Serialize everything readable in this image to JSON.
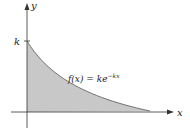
{
  "diagram": {
    "y_axis_label": "y",
    "x_axis_label": "x",
    "y_intercept_label": "k",
    "function_label_lhs": "f(x) = ke",
    "function_label_exp": "−kx",
    "fill_color": "#c8c8c8",
    "stroke_color": "#444444"
  }
}
